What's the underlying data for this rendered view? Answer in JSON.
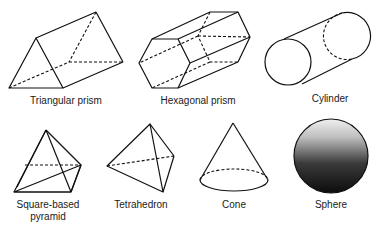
{
  "shapes": [
    {
      "id": "triangular-prism",
      "label": "Triangular prism"
    },
    {
      "id": "hexagonal-prism",
      "label": "Hexagonal prism"
    },
    {
      "id": "cylinder",
      "label": "Cylinder"
    },
    {
      "id": "square-based-pyramid",
      "label": "Square-based\npyramid"
    },
    {
      "id": "tetrahedron",
      "label": "Tetrahedron"
    },
    {
      "id": "cone",
      "label": "Cone"
    },
    {
      "id": "sphere",
      "label": "Sphere"
    }
  ],
  "colors": {
    "line": "#111111",
    "background": "#ffffff",
    "sphere_top": "#e8e8e8",
    "sphere_bottom": "#111111"
  }
}
